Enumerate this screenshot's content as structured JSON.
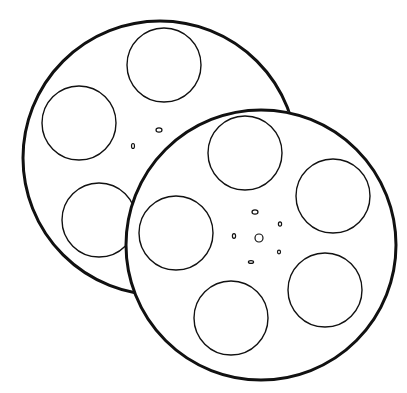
{
  "image": {
    "subject": "two film reels line drawing",
    "width": 407,
    "height": 393,
    "background": "#ffffff",
    "stroke_color": "#111111"
  },
  "reels": [
    {
      "name": "back-reel",
      "cx": 160,
      "cy": 158,
      "r": 137,
      "rim_width": 3,
      "holes": [
        {
          "cx": 164,
          "cy": 65,
          "r": 37
        },
        {
          "cx": 79,
          "cy": 123,
          "r": 37
        },
        {
          "cx": 99,
          "cy": 220,
          "r": 37
        }
      ],
      "hub_marks": [
        {
          "cx": 159,
          "cy": 130,
          "rx": 3,
          "ry": 2.2
        },
        {
          "cx": 133,
          "cy": 146,
          "rx": 1.5,
          "ry": 2.5
        }
      ]
    },
    {
      "name": "front-reel",
      "cx": 261,
      "cy": 245,
      "r": 135,
      "rim_width": 3,
      "holes": [
        {
          "cx": 245,
          "cy": 153,
          "r": 37
        },
        {
          "cx": 333,
          "cy": 196,
          "r": 37
        },
        {
          "cx": 176,
          "cy": 233,
          "r": 37
        },
        {
          "cx": 325,
          "cy": 290,
          "r": 37
        },
        {
          "cx": 231,
          "cy": 318,
          "r": 37
        }
      ],
      "hub_marks": [
        {
          "cx": 259,
          "cy": 238,
          "rx": 4,
          "ry": 4
        },
        {
          "cx": 255,
          "cy": 212,
          "rx": 3,
          "ry": 2.2
        },
        {
          "cx": 280,
          "cy": 224,
          "rx": 1.6,
          "ry": 2.2
        },
        {
          "cx": 234,
          "cy": 236,
          "rx": 1.6,
          "ry": 2.4
        },
        {
          "cx": 279,
          "cy": 252,
          "rx": 1.5,
          "ry": 1.8
        },
        {
          "cx": 251,
          "cy": 262,
          "rx": 2.6,
          "ry": 1.4
        }
      ]
    }
  ]
}
